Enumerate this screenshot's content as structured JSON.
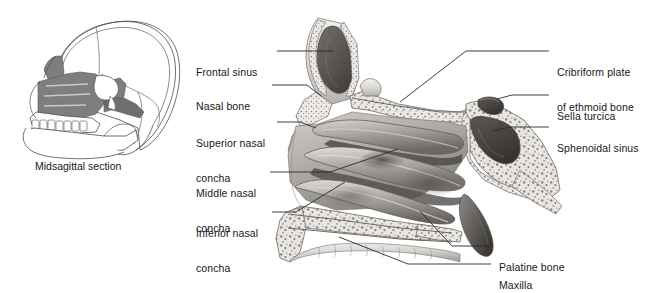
{
  "figure": {
    "inset_caption": "Midsagittal section",
    "background_color": "#ffffff",
    "text_color": "#17171a",
    "leader_color": "#2a2a2a",
    "bone_light": "#e8e6e2",
    "bone_mid": "#b9b6b2",
    "bone_dark": "#6f6c6a",
    "cavity_dark": "#4a4745",
    "inset_shade": "#7f7f7f"
  },
  "labels_left": [
    {
      "id": "frontal-sinus",
      "line1": "Frontal sinus",
      "line2": "",
      "x": 196,
      "y": 46
    },
    {
      "id": "nasal-bone",
      "line1": "Nasal bone",
      "line2": "",
      "x": 196,
      "y": 80
    },
    {
      "id": "superior-nasal-concha",
      "line1": "Superior nasal",
      "line2": "concha",
      "x": 196,
      "y": 117
    },
    {
      "id": "middle-nasal-concha",
      "line1": "Middle nasal",
      "line2": "concha",
      "x": 196,
      "y": 167
    },
    {
      "id": "inferior-nasal-concha",
      "line1": "Inferior nasal",
      "line2": "concha",
      "x": 196,
      "y": 207
    }
  ],
  "labels_right": [
    {
      "id": "cribriform-plate",
      "line1": "Cribriform plate",
      "line2": "of ethmoid bone",
      "x": 557,
      "y": 46
    },
    {
      "id": "sella-turcica",
      "line1": "Sella turcica",
      "line2": "",
      "x": 557,
      "y": 90
    },
    {
      "id": "sphenoidal-sinus",
      "line1": "Sphenoidal sinus",
      "line2": "",
      "x": 557,
      "y": 122
    },
    {
      "id": "palatine-bone",
      "line1": "Palatine bone",
      "line2": "",
      "x": 499,
      "y": 241
    },
    {
      "id": "maxilla",
      "line1": "Maxilla",
      "line2": "",
      "x": 499,
      "y": 259
    }
  ],
  "leaders": [
    {
      "id": "leader-frontal-sinus",
      "points": "277,51 333,51"
    },
    {
      "id": "leader-nasal-bone",
      "points": "272,85 307,85 321,96"
    },
    {
      "id": "leader-superior-concha",
      "points": "277,122 300,122 316,128"
    },
    {
      "id": "leader-middle-concha",
      "points": "270,172 330,172 398,149"
    },
    {
      "id": "leader-inferior-concha",
      "points": "272,212 296,212 345,182"
    },
    {
      "id": "leader-cribriform",
      "points": "549,51 466,51 400,102"
    },
    {
      "id": "leader-sella-turcica",
      "points": "549,95 512,95 497,99"
    },
    {
      "id": "leader-sphenoidal",
      "points": "549,127 510,127 493,131"
    },
    {
      "id": "leader-palatine-bone",
      "points": "491,246 452,246 420,211"
    },
    {
      "id": "leader-maxilla",
      "points": "491,264 408,264 339,237"
    }
  ],
  "inset": {
    "id": "skull-inset",
    "caption": "Midsagittal section",
    "caption_x": 35,
    "caption_y": 162,
    "shaded_region_name": "nasal-and-maxillary-region"
  }
}
